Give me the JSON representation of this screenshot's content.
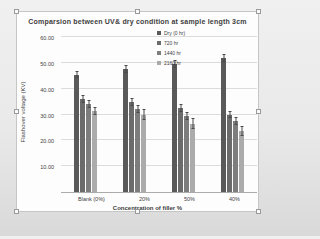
{
  "chart_data": {
    "type": "bar",
    "title": "Comparsion between UV& dry condition at sample length 3cm",
    "xlabel": "Concentration of filler %",
    "ylabel": "Flashover voltage (KV)",
    "categories": [
      "Blank (0%)",
      "20%",
      "50%",
      "40%"
    ],
    "series": [
      {
        "name": "Dry (0 hr)",
        "color": "#595959",
        "values": [
          45.5,
          47.5,
          49.5,
          52.0
        ],
        "errors": [
          1.5,
          1.5,
          1.5,
          1.5
        ]
      },
      {
        "name": "720 hr",
        "color": "#6b6b6b",
        "values": [
          36.0,
          35.0,
          32.5,
          30.0
        ],
        "errors": [
          1.5,
          1.5,
          1.5,
          1.5
        ]
      },
      {
        "name": "1440 hr",
        "color": "#7d7d7d",
        "values": [
          34.0,
          32.0,
          29.5,
          27.5
        ],
        "errors": [
          1.5,
          1.5,
          1.5,
          1.5
        ]
      },
      {
        "name": "2160 hr",
        "color": "#ababab",
        "values": [
          31.5,
          30.0,
          26.5,
          23.5
        ],
        "errors": [
          1.5,
          2.0,
          2.0,
          2.0
        ]
      }
    ],
    "ylim": [
      0,
      60
    ],
    "yticks": [
      "60.00",
      "50.00",
      "40.00",
      "30.00",
      "20.00",
      "10.00"
    ],
    "grid": true,
    "legend_position": "top-right-inside",
    "error_bar_color": "#4a4a4a"
  }
}
